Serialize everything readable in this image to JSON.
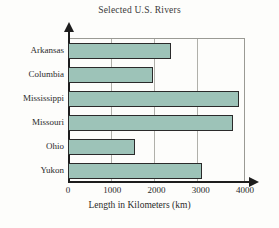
{
  "chart_data": {
    "type": "bar",
    "orientation": "horizontal",
    "title": "Selected U.S. Rivers",
    "xlabel": "Length in Kilometers (km)",
    "ylabel": "",
    "categories": [
      "Arkansas",
      "Columbia",
      "Mississippi",
      "Missouri",
      "Ohio",
      "Yukon"
    ],
    "values": [
      2330,
      1930,
      3860,
      3740,
      1510,
      3030
    ],
    "xlim": [
      0,
      4000
    ],
    "xticks": [
      0,
      1000,
      2000,
      3000,
      4000
    ],
    "xtick_labels": [
      "0",
      "1000",
      "2000",
      "3000",
      "4000"
    ],
    "grid": "vertical",
    "legend": null,
    "series": [
      {
        "name": "Length",
        "values": [
          2330,
          1930,
          3860,
          3740,
          1510,
          3030
        ]
      }
    ],
    "bar_fill_color": "#9dc3b8",
    "bar_edge_color": "#2a2a2a",
    "axis_color": "#1d1d1d",
    "grid_color": "#b0b0aa",
    "background_color": "#fdfdfb"
  }
}
